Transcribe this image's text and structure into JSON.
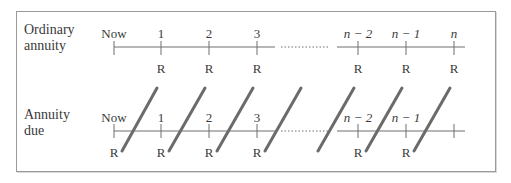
{
  "diagram": {
    "colors": {
      "line": "#6e6e6e",
      "arrow": "#6b6b6b",
      "text": "#3a3a3a",
      "border": "#9a9a9a"
    },
    "ordinary": {
      "label_line1": "Ordinary",
      "label_line2": "annuity",
      "tick_labels": [
        "Now",
        "1",
        "2",
        "3",
        "n − 2",
        "n − 1",
        "n"
      ],
      "payment_labels": [
        "R",
        "R",
        "R",
        "R",
        "R",
        "R"
      ]
    },
    "due": {
      "label_line1": "Annuity",
      "label_line2": "due",
      "tick_labels": [
        "Now",
        "1",
        "2",
        "3",
        "n − 2",
        "n − 1"
      ],
      "payment_labels": [
        "R",
        "R",
        "R",
        "R",
        "R",
        "R"
      ]
    }
  }
}
